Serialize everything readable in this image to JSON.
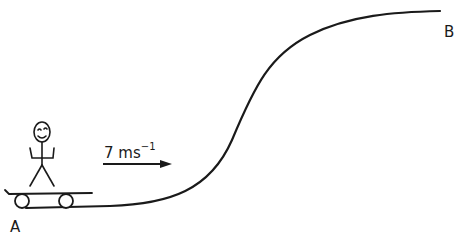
{
  "diagram": {
    "title": "",
    "point_start_label": "A",
    "point_end_label": "B",
    "velocity": {
      "value": "7",
      "unit": "ms",
      "exponent": "−1"
    },
    "colors": {
      "stroke": "#1a1a1a",
      "background": "#ffffff"
    }
  }
}
